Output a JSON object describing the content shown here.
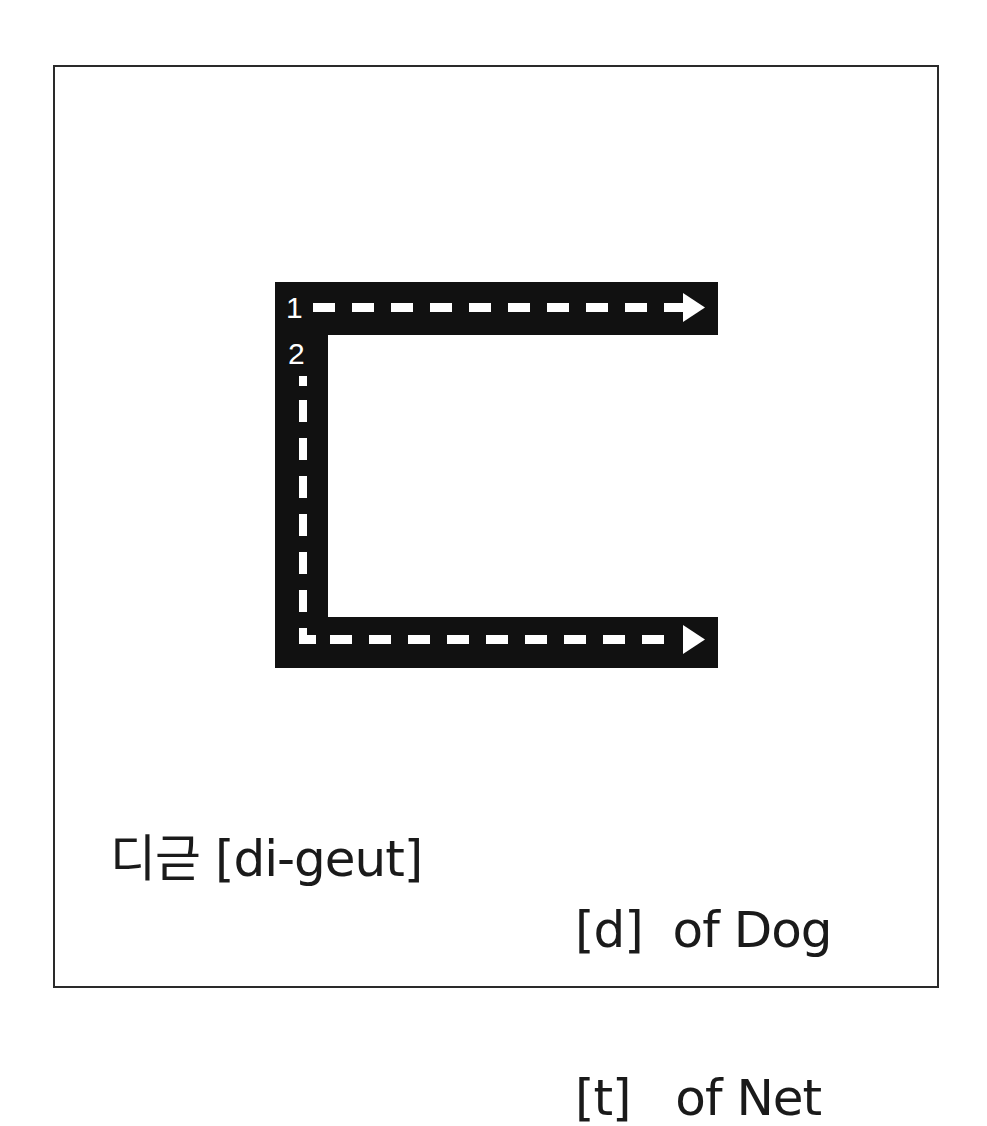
{
  "letter": {
    "character": "ㄷ",
    "stroke_color": "#111111",
    "guide_color": "#ffffff",
    "strokes": [
      {
        "number": "1",
        "direction": "left-to-right"
      },
      {
        "number": "2",
        "direction": "top-to-bottom-then-right"
      }
    ]
  },
  "caption": {
    "name": "디귿 [di-geut]",
    "sounds": [
      {
        "phoneme": "[d]",
        "example": "of Dog"
      },
      {
        "phoneme": "[t]",
        "example": "of Net"
      }
    ]
  }
}
